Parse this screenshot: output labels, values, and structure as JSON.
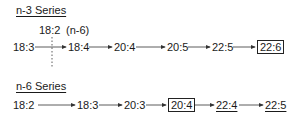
{
  "series": [
    {
      "title": "n-3 Series",
      "annotation": {
        "branch_label": "18:2",
        "branch_note": "(n-6)"
      },
      "nodes": [
        {
          "label": "18:3",
          "style": "plain"
        },
        {
          "label": "18:4",
          "style": "plain"
        },
        {
          "label": "20:4",
          "style": "plain"
        },
        {
          "label": "20:5",
          "style": "plain"
        },
        {
          "label": "22:5",
          "style": "plain"
        },
        {
          "label": "22:6",
          "style": "boxed"
        }
      ]
    },
    {
      "title": "n-6 Series",
      "nodes": [
        {
          "label": "18:2",
          "style": "plain"
        },
        {
          "label": "18:3",
          "style": "plain"
        },
        {
          "label": "20:3",
          "style": "plain"
        },
        {
          "label": "20:4",
          "style": "boxed"
        },
        {
          "label": "22:4",
          "style": "underlined"
        },
        {
          "label": "22:5",
          "style": "underlined"
        }
      ]
    }
  ],
  "colors": {
    "text": "#1a1a1a",
    "line": "#333333",
    "background": "#ffffff"
  }
}
